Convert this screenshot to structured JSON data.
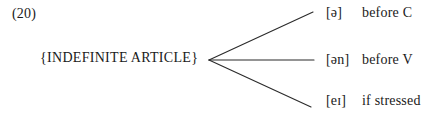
{
  "figure": {
    "example_number": "(20)",
    "root_label": "{INDEFINITE ARTICLE}",
    "ink_color": "#2b2b2b",
    "background_color": "#ffffff",
    "branches": [
      {
        "ipa": "[ə]",
        "context": "before C"
      },
      {
        "ipa": "[ən]",
        "context": "before V"
      },
      {
        "ipa": "[eɪ]",
        "context": "if stressed"
      }
    ],
    "geometry": {
      "vertex_x": 209,
      "vertex_y": 60,
      "endpoints": [
        {
          "x": 313,
          "y": 12
        },
        {
          "x": 314,
          "y": 60
        },
        {
          "x": 311,
          "y": 107
        }
      ]
    }
  }
}
